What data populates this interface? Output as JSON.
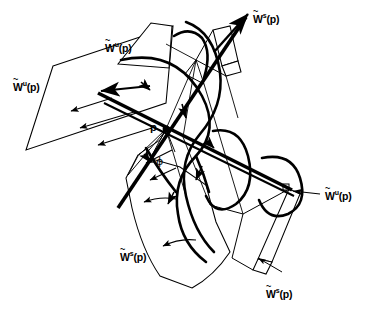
{
  "figure": {
    "background_color": "#ffffff",
    "stroke_color": "#000000",
    "width": 366,
    "height": 310
  },
  "labels": {
    "unstable_top": {
      "base": "W",
      "tilde": "~",
      "sup": "u",
      "arg": "(p)",
      "text": "W̃ᵘ(p)"
    },
    "unstable_left": {
      "base": "W",
      "tilde": "~",
      "sup": "u",
      "arg": "(p)",
      "text": "W̃ᵘ(p)"
    },
    "unstable_right": {
      "base": "W",
      "tilde": "~",
      "sup": "u",
      "arg": "(p)",
      "text": "W̃ᵘ(p)"
    },
    "stable_top_right": {
      "base": "W",
      "tilde": "~",
      "sup": "s",
      "arg": "(p)",
      "text": "W̃ˢ(p)"
    },
    "stable_bottom_left": {
      "base": "W",
      "tilde": "~",
      "sup": "s",
      "arg": "(p)",
      "text": "W̃ˢ(p)"
    },
    "stable_bottom_right": {
      "base": "W",
      "tilde": "~",
      "sup": "s",
      "arg": "(p)",
      "text": "W̃ˢ(p)"
    },
    "fixed_point": "p",
    "angle": "ϕ"
  },
  "annotations": {
    "leader_right_note": "arrow from right label to manifold edge",
    "leader_bottom_note": "arrow from bottom-right label to ribbon tip"
  }
}
